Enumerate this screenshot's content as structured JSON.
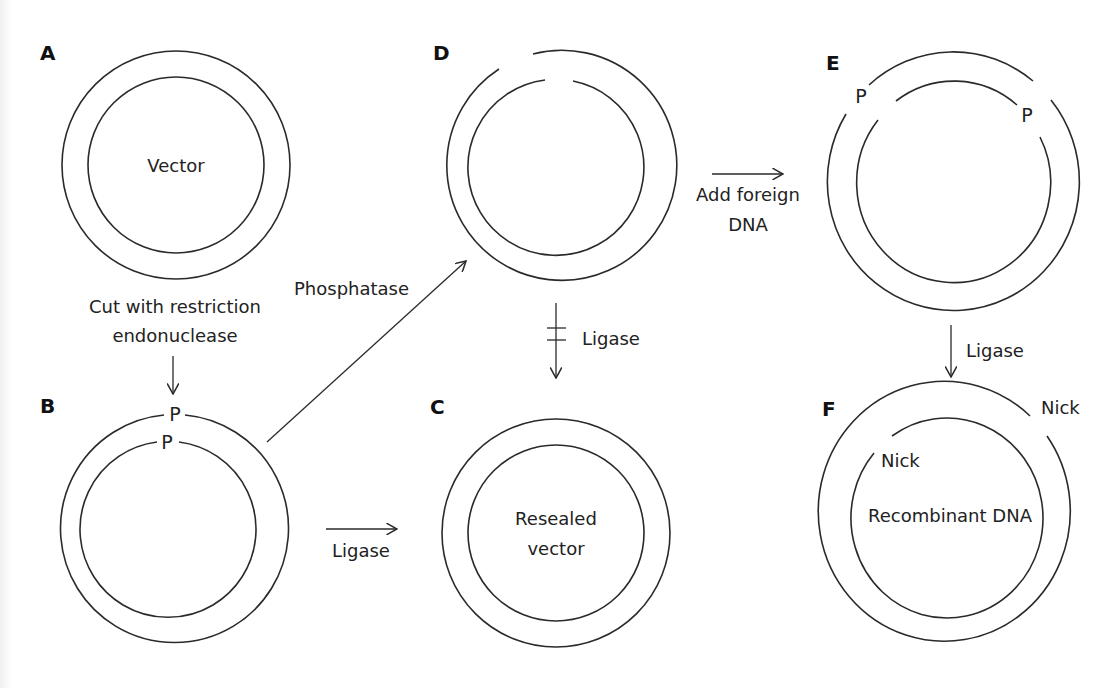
{
  "figure": {
    "colors": {
      "stroke": "#2a2a2a",
      "text": "#222222",
      "panel_label": "#111111",
      "background": "#ffffff"
    },
    "panels": {
      "A": {
        "label": "A",
        "center_text": "Vector"
      },
      "B": {
        "label": "B",
        "outer_mark": "P",
        "inner_mark": "P"
      },
      "C": {
        "label": "C",
        "center_text_line1": "Resealed",
        "center_text_line2": "vector"
      },
      "D": {
        "label": "D"
      },
      "E": {
        "label": "E",
        "left_mark": "P",
        "right_mark": "P"
      },
      "F": {
        "label": "F",
        "outer_nick": "Nick",
        "inner_nick": "Nick",
        "center_text": "Recombinant DNA"
      }
    },
    "steps": {
      "a_to_b": {
        "line1": "Cut with restriction",
        "line2": "endonuclease"
      },
      "b_to_d": {
        "label": "Phosphatase"
      },
      "b_to_c": {
        "label": "Ligase"
      },
      "d_to_c_blocked": {
        "label": "Ligase"
      },
      "d_to_e": {
        "line1": "Add foreign",
        "line2": "DNA"
      },
      "e_to_f": {
        "label": "Ligase"
      }
    }
  }
}
